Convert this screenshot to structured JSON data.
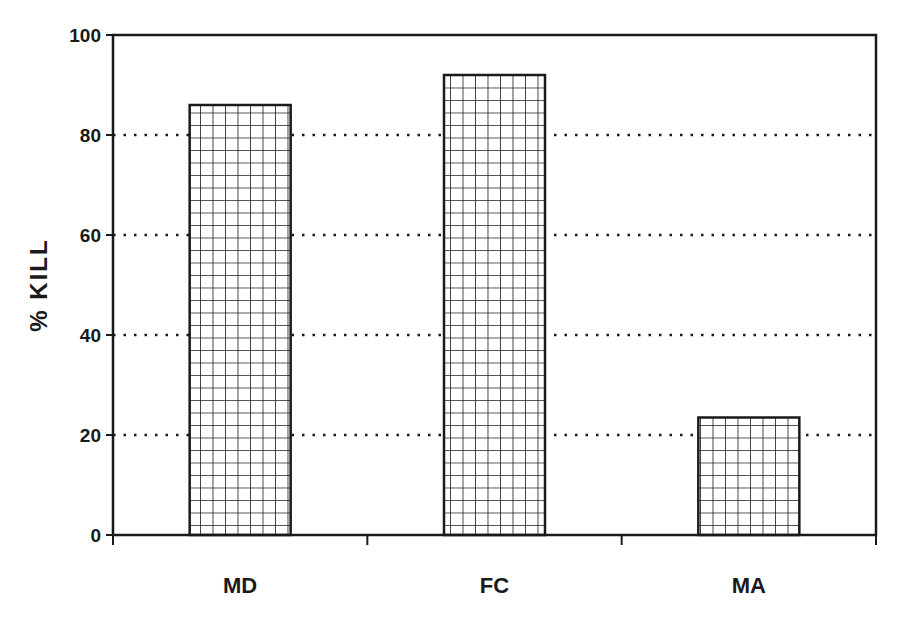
{
  "chart_data": {
    "type": "bar",
    "title": "",
    "xlabel": "",
    "ylabel": "% KILL",
    "categories": [
      "MD",
      "FC",
      "MA"
    ],
    "values": [
      86,
      92,
      23.5
    ],
    "ylim": [
      0,
      100
    ],
    "yticks": [
      "0",
      "20",
      "40",
      "60",
      "80",
      "100"
    ],
    "grid": "horizontal dotted at 20,40,60,80",
    "legend": "none",
    "bar_fill": "crosshatch grid"
  },
  "colors": {
    "ink": "#1a1a1a",
    "background": "#ffffff"
  }
}
